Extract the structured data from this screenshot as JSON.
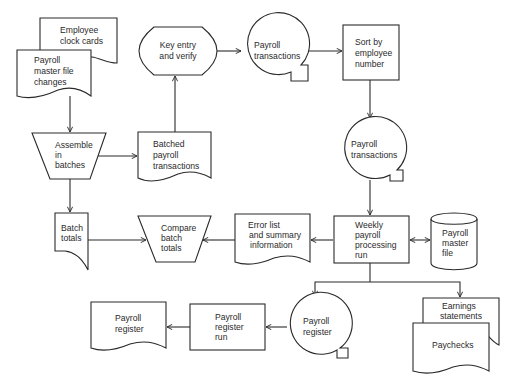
{
  "diagram": {
    "type": "system flowchart",
    "colors": {
      "stroke": "#2a2a2a",
      "background": "#ffffff"
    },
    "nodes": {
      "employee_clock_cards": {
        "shape": "document",
        "lines": [
          "Employee",
          "clock cards"
        ]
      },
      "payroll_master_file_changes": {
        "shape": "document",
        "lines": [
          "Payroll",
          "master file",
          "changes"
        ]
      },
      "assemble_in_batches": {
        "shape": "manual-operation",
        "lines": [
          "Assemble",
          "in",
          "batches"
        ]
      },
      "batched_payroll_transactions": {
        "shape": "document",
        "lines": [
          "Batched",
          "payroll",
          "transactions"
        ]
      },
      "key_entry_and_verify": {
        "shape": "terminal",
        "lines": [
          "Key entry",
          "and verify"
        ]
      },
      "payroll_transactions_tape_1": {
        "shape": "magnetic-tape",
        "lines": [
          "Payroll",
          "transactions"
        ]
      },
      "sort_by_employee_number": {
        "shape": "process",
        "lines": [
          "Sort by",
          "employee",
          "number"
        ]
      },
      "payroll_transactions_tape_2": {
        "shape": "magnetic-tape",
        "lines": [
          "Payroll",
          "transactions"
        ]
      },
      "batch_totals": {
        "shape": "document",
        "lines": [
          "Batch",
          "totals"
        ]
      },
      "compare_batch_totals": {
        "shape": "manual-operation",
        "lines": [
          "Compare",
          "batch",
          "totals"
        ]
      },
      "error_list_and_summary": {
        "shape": "document",
        "lines": [
          "Error list",
          "and summary",
          "information"
        ]
      },
      "weekly_payroll_processing_run": {
        "shape": "process",
        "lines": [
          "Weekly",
          "payroll",
          "processing",
          "run"
        ]
      },
      "payroll_master_file": {
        "shape": "disk",
        "lines": [
          "Payroll",
          "master",
          "file"
        ]
      },
      "payroll_register_tape": {
        "shape": "magnetic-tape",
        "lines": [
          "Payroll",
          "register"
        ]
      },
      "payroll_register_run": {
        "shape": "process",
        "lines": [
          "Payroll",
          "register",
          "run"
        ]
      },
      "payroll_register_report": {
        "shape": "document",
        "lines": [
          "Payroll",
          "register"
        ]
      },
      "earnings_statements": {
        "shape": "document",
        "lines": [
          "Earnings",
          "statements"
        ]
      },
      "paychecks": {
        "shape": "document",
        "lines": [
          "Paychecks"
        ]
      }
    },
    "edges": [
      {
        "from": "payroll_master_file_changes",
        "to": "assemble_in_batches"
      },
      {
        "from": "assemble_in_batches",
        "to": "batched_payroll_transactions"
      },
      {
        "from": "assemble_in_batches",
        "to": "batch_totals"
      },
      {
        "from": "batched_payroll_transactions",
        "to": "key_entry_and_verify"
      },
      {
        "from": "key_entry_and_verify",
        "to": "payroll_transactions_tape_1"
      },
      {
        "from": "payroll_transactions_tape_1",
        "to": "sort_by_employee_number"
      },
      {
        "from": "sort_by_employee_number",
        "to": "payroll_transactions_tape_2"
      },
      {
        "from": "payroll_transactions_tape_2",
        "to": "weekly_payroll_processing_run"
      },
      {
        "from": "weekly_payroll_processing_run",
        "to": "payroll_master_file",
        "bidirectional": true
      },
      {
        "from": "weekly_payroll_processing_run",
        "to": "error_list_and_summary"
      },
      {
        "from": "error_list_and_summary",
        "to": "compare_batch_totals"
      },
      {
        "from": "batch_totals",
        "to": "compare_batch_totals"
      },
      {
        "from": "weekly_payroll_processing_run",
        "to": "payroll_register_tape"
      },
      {
        "from": "weekly_payroll_processing_run",
        "to": "earnings_statements"
      },
      {
        "from": "payroll_register_tape",
        "to": "payroll_register_run"
      },
      {
        "from": "payroll_register_run",
        "to": "payroll_register_report"
      }
    ]
  }
}
